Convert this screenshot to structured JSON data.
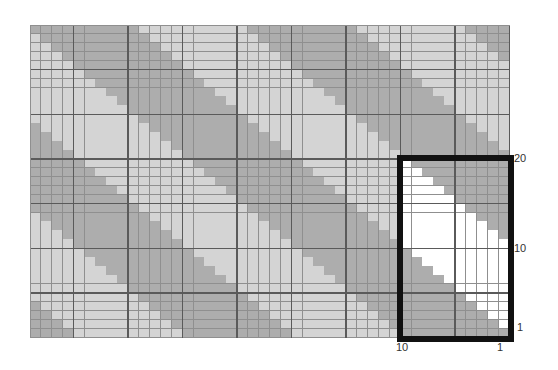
{
  "diagram": {
    "type": "knitting-chart-grid",
    "columns": 44,
    "rows": 35,
    "cell_width_px": 10.9,
    "cell_height_px": 8.93,
    "origin": {
      "x": 30,
      "y": 25
    },
    "thick_line_every": 5,
    "thick_col_offset": 4,
    "thick_row_offset": 0,
    "stripe": {
      "description": "diagonal bands shifting one column right per row",
      "period": 20,
      "dark_width": 10
    },
    "colors": {
      "dark": "#adadad",
      "light": "#d4d4d4",
      "highlight_light": "#ffffff",
      "grid_line": "#8f8f8f",
      "thick_line": "#5a5a5a",
      "box_border": "#111111"
    },
    "highlight_box": {
      "col_start": 34,
      "col_end": 43,
      "row_start": 15,
      "row_end": 34,
      "width_stitches": 10,
      "height_rows": 20
    },
    "labels": {
      "bottom_left": "10",
      "bottom_right": "1",
      "right_top": "20",
      "right_middle": "10",
      "right_bottom": "1"
    }
  }
}
